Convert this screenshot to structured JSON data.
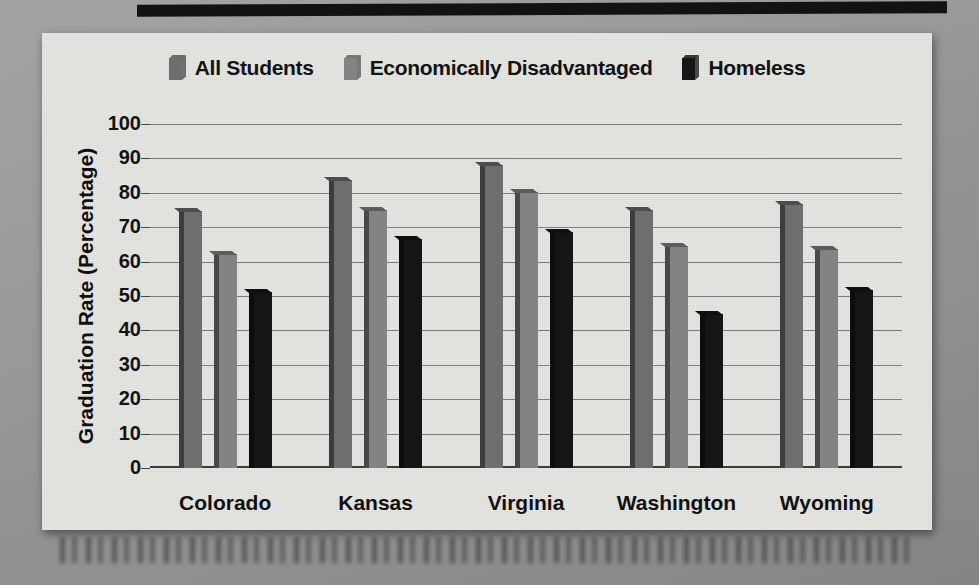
{
  "chart_data": {
    "type": "bar",
    "title": "",
    "xlabel": "",
    "ylabel": "Graduation Rate (Percentage)",
    "ylim": [
      0,
      100
    ],
    "ytick_step": 10,
    "yticks": [
      "100",
      "90",
      "80",
      "70",
      "60",
      "50",
      "40",
      "30",
      "20",
      "10",
      "0"
    ],
    "grid": true,
    "legend_position": "top-center",
    "categories": [
      "Colorado",
      "Kansas",
      "Virginia",
      "Washington",
      "Wyoming"
    ],
    "series": [
      {
        "name": "All Students",
        "color": "#6e6e6e",
        "values": [
          75.5,
          84.5,
          89,
          76,
          77.5
        ]
      },
      {
        "name": "Economically Disadvantaged",
        "color": "#838383",
        "values": [
          63,
          76,
          81,
          65.5,
          64.5
        ]
      },
      {
        "name": "Homeless",
        "color": "#151515",
        "values": [
          52,
          67.5,
          69.5,
          45.5,
          52.5
        ]
      }
    ]
  },
  "legend": {
    "items": [
      {
        "label": "All Students",
        "swatch_color": "#6e6e6e"
      },
      {
        "label": "Economically Disadvantaged",
        "swatch_color": "#838383"
      },
      {
        "label": "Homeless",
        "swatch_color": "#151515"
      }
    ]
  },
  "axes": {
    "y_title": "Graduation Rate (Percentage)"
  }
}
